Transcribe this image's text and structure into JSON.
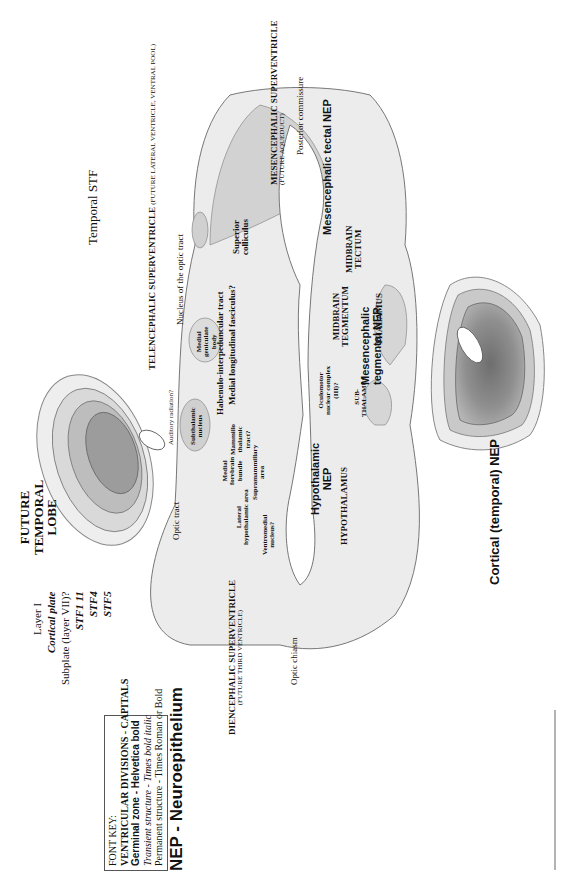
{
  "font_key": {
    "title": "FONT KEY:",
    "lines": [
      "VENTRICULAR DIVISIONS - CAPITALS",
      "Germinal zone - Helvetica bold",
      "Transient structure - Times bold italic",
      "Permanent structure - Times Roman or Bold"
    ]
  },
  "legend_title": "NEP - Neuroepithelium",
  "temporal_lobe": {
    "title_lines": [
      "FUTURE",
      "TEMPORAL",
      "LOBE"
    ],
    "temporal_stf": "Temporal STF",
    "layers": [
      "Layer I",
      "Cortical plate",
      "Subplate (layer VII)?",
      "STF1 11",
      "STF4",
      "STF5"
    ]
  },
  "main_section": {
    "telencephalic_superventricle": "TELENCEPHALIC SUPERVENTRICLE",
    "telencephalic_superventricle_note": "(FUTURE LATERAL VENTRICLE, VENTRAL POOL)",
    "mesencephalic_superventricle": "MESENCEPHALIC SUPERVENTRICLE",
    "mesencephalic_superventricle_note": "(FUTURE AQUEDUCT)",
    "diencephalic_superventricle": "DIENCEPHALIC SUPERVENTRICLE",
    "diencephalic_superventricle_note": "(FUTURE THIRD VENTRICLE)",
    "posterior_commissure": "Posterior commissure",
    "mesencephalic_tectal_nep": "Mesencephalic tectal NEP",
    "mesencephalic_tegmental_nep": [
      "Mesencephalic",
      "tegmental NEP"
    ],
    "superior_colliculus": [
      "Superior",
      "colliculus"
    ],
    "medial_longitudinal_fasciculus": "Medial longitudinal fasciculus?",
    "habenulo_interpeduncular_tract": "Habenulo-interpeduncular tract",
    "nucleus_optic_tract": "Nucleus of the optic tract",
    "auditory_radiation": "Auditory radiation?",
    "medial_geniculate_body": [
      "Medial",
      "geniculate",
      "body"
    ],
    "mammillo_thalamic_tract": [
      "Mammillo",
      "thalamic",
      "tract?"
    ],
    "medial_forebrain_bundle": [
      "Medial",
      "forebrain",
      "bundle"
    ],
    "subthalamic_nucleus": [
      "Subthalamic",
      "nucleus"
    ],
    "supramammillary_area": [
      "Supramammillary",
      "area"
    ],
    "lateral_hypothalamic_area": [
      "Lateral",
      "hypothalamic area"
    ],
    "ventromedial_nucleus": [
      "Ventromedial",
      "nucleus?"
    ],
    "oculomotor_complex": [
      "Oculomotor",
      "nuclear complex",
      "(III)?"
    ],
    "midbrain_tectum": [
      "MIDBRAIN",
      "TECTUM"
    ],
    "midbrain_tegmentum": [
      "MIDBRAIN",
      "TEGMENTUM"
    ],
    "thalamus": "THALAMUS",
    "subthalamus": [
      "SUB-",
      "THALAMUS"
    ],
    "hypothalamic_nep": [
      "Hypothalamic",
      "NEP"
    ],
    "hypothalamus": "HYPOTHALAMUS",
    "optic_tract": "Optic tract",
    "optic_chiasm": "Optic chiasm"
  },
  "cortical_section": {
    "label": "Cortical (temporal) NEP"
  },
  "colors": {
    "outline": "#777777",
    "light_fill": "#ececec",
    "mid_fill": "#cfcfcf",
    "dark_fill": "#9a9a9a",
    "ventricle": "#ffffff",
    "text": "#111111"
  }
}
